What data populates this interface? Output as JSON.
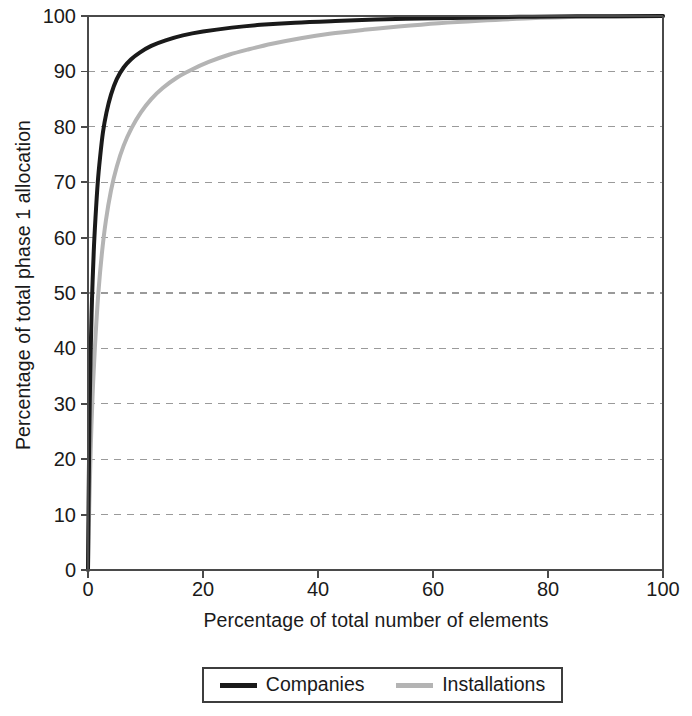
{
  "chart_data": {
    "type": "line",
    "title": "",
    "subtitle": "",
    "xlabel": "Percentage of total number of elements",
    "ylabel": "Percentage of total phase 1 allocation",
    "xlim": [
      0,
      100
    ],
    "ylim": [
      0,
      100
    ],
    "xticks": [
      0,
      20,
      40,
      60,
      80,
      100
    ],
    "yticks": [
      0,
      10,
      20,
      30,
      40,
      50,
      60,
      70,
      80,
      90,
      100
    ],
    "xtick_labels": [
      "0",
      "20",
      "40",
      "60",
      "80",
      "100"
    ],
    "ytick_labels": [
      "0",
      "10",
      "20",
      "30",
      "40",
      "50",
      "60",
      "70",
      "80",
      "90",
      "100"
    ],
    "grid": "horizontal-dashed",
    "legend_position": "below-center",
    "series": [
      {
        "name": "Companies",
        "color": "#1a1a1a",
        "linewidth": 4,
        "x": [
          0,
          0.1,
          0.2,
          0.3,
          0.5,
          0.7,
          1.0,
          1.3,
          1.7,
          2.1,
          2.6,
          3.2,
          4.0,
          5.0,
          6.2,
          7.5,
          9.0,
          11.0,
          13.5,
          16.5,
          20.0,
          25.0,
          30.0,
          36.0,
          43.0,
          50.0,
          58.0,
          66.0,
          75.0,
          85.0,
          100.0
        ],
        "y": [
          0,
          12.0,
          22.0,
          30.0,
          41.0,
          49.0,
          57.5,
          63.5,
          70.0,
          74.5,
          79.0,
          82.5,
          85.8,
          88.6,
          90.7,
          92.2,
          93.4,
          94.6,
          95.6,
          96.5,
          97.2,
          97.9,
          98.4,
          98.8,
          99.1,
          99.35,
          99.55,
          99.7,
          99.85,
          99.94,
          100.0
        ]
      },
      {
        "name": "Installations",
        "color": "#b4b4b4",
        "linewidth": 4,
        "x": [
          0,
          0.2,
          0.4,
          0.6,
          0.9,
          1.3,
          1.8,
          2.4,
          3.1,
          4.0,
          5.0,
          6.2,
          7.6,
          9.2,
          11.0,
          13.0,
          15.5,
          18.0,
          21.0,
          24.5,
          28.0,
          32.0,
          37.0,
          42.0,
          48.0,
          54.0,
          61.0,
          68.0,
          76.0,
          86.0,
          100.0
        ],
        "y": [
          0,
          10.5,
          19.0,
          26.0,
          34.0,
          42.0,
          50.0,
          57.0,
          63.0,
          68.5,
          72.8,
          76.6,
          79.8,
          82.6,
          85.0,
          87.0,
          88.9,
          90.3,
          91.7,
          93.0,
          94.0,
          95.0,
          96.0,
          96.8,
          97.5,
          98.1,
          98.7,
          99.15,
          99.55,
          99.85,
          100.0
        ]
      }
    ]
  },
  "axis": {
    "ylabel_text": "Percentage of total phase 1 allocation",
    "xlabel_text": "Percentage of total number of elements"
  },
  "legend": {
    "entries": [
      {
        "label": "Companies",
        "color": "#1a1a1a",
        "swatch": "thick-black-line"
      },
      {
        "label": "Installations",
        "color": "#b4b4b4",
        "swatch": "thick-gray-line"
      }
    ]
  },
  "colors": {
    "companies": "#1a1a1a",
    "installations": "#b4b4b4",
    "axis": "#4a4a4a",
    "grid": "#9a9a9a",
    "background": "#ffffff"
  }
}
